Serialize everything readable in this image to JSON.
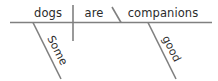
{
  "diagram": {
    "type": "reed-kellogg-sentence-diagram",
    "sentence": "Some dogs are good companions",
    "baseline": {
      "name": "baseline",
      "x1": 10,
      "x2": 212,
      "y": 22.5
    },
    "dividers": [
      {
        "name": "subject-verb-divider",
        "kind": "vertical",
        "x": 73,
        "y1": 5,
        "y2": 41
      },
      {
        "name": "linking-verb-complement-divider",
        "kind": "slanted-back",
        "x1": 112,
        "y1": 7,
        "x2": 121,
        "y2": 22.5
      }
    ],
    "modifier_lines": [
      {
        "name": "modifier-line-some",
        "x1": 33,
        "y1": 22.5,
        "x2": 61,
        "y2": 79
      },
      {
        "name": "modifier-line-good",
        "x1": 148,
        "y1": 22.5,
        "x2": 176,
        "y2": 79
      }
    ],
    "words": [
      {
        "name": "subject-word",
        "text": "dogs",
        "role": "subject",
        "x": 48,
        "y": 17,
        "rotation": 0,
        "anchor": "middle"
      },
      {
        "name": "verb-word",
        "text": "are",
        "role": "linking-verb",
        "x": 94,
        "y": 17,
        "rotation": 0,
        "anchor": "middle"
      },
      {
        "name": "complement-word",
        "text": "companions",
        "role": "predicate-nominative",
        "x": 163,
        "y": 17,
        "rotation": 0,
        "anchor": "middle"
      },
      {
        "name": "modifier-word-some",
        "text": "Some",
        "role": "adjective-modifying-subject",
        "x": 47,
        "y": 38,
        "rotation": 63,
        "anchor": "start"
      },
      {
        "name": "modifier-word-good",
        "text": "good",
        "role": "adjective-modifying-complement",
        "x": 162,
        "y": 38,
        "rotation": 63,
        "anchor": "start"
      }
    ],
    "colors": {
      "line": "#808080",
      "text": "#2b2b2b",
      "background": "#ffffff"
    }
  }
}
